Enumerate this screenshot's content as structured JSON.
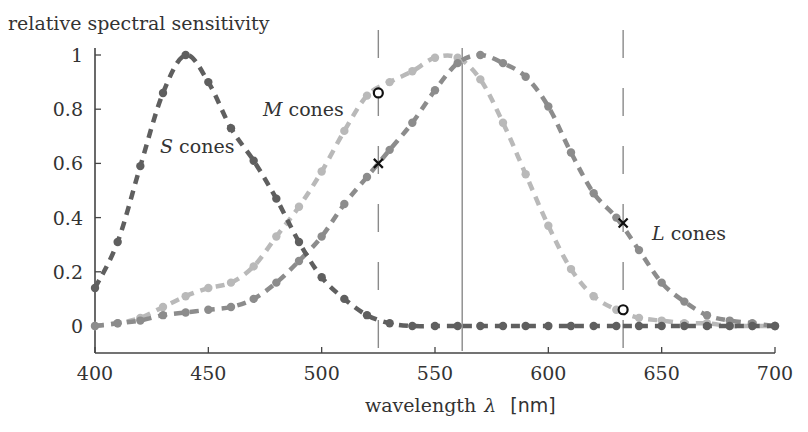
{
  "chart_data": {
    "type": "line",
    "title": "",
    "ylabel": "relative spectral sensitivity",
    "xlabel": "wavelength λ [nm]",
    "xlabel_text": "wavelength",
    "xlabel_symbol": "λ",
    "xlabel_unit": "[nm]",
    "xlim": [
      400,
      700
    ],
    "ylim": [
      -0.1,
      1.05
    ],
    "xticks": [
      400,
      450,
      500,
      550,
      600,
      650,
      700
    ],
    "yticks": [
      0,
      0.2,
      0.4,
      0.6,
      0.8,
      1
    ],
    "ytick_labels": [
      "0",
      "0.2",
      "0.4",
      "0.6",
      "0.8",
      "1"
    ],
    "xtick_labels": [
      "400",
      "450",
      "500",
      "550",
      "600",
      "650",
      "700"
    ],
    "grid": false,
    "legend": "none (inline labels)",
    "x": [
      400,
      410,
      420,
      430,
      440,
      450,
      460,
      470,
      480,
      490,
      500,
      510,
      520,
      530,
      540,
      550,
      560,
      570,
      580,
      590,
      600,
      610,
      620,
      630,
      640,
      650,
      660,
      670,
      680,
      690,
      700
    ],
    "series": [
      {
        "name": "S cones",
        "label_italic": "S",
        "label_rest": " cones",
        "color": "#5f5f5f",
        "values": [
          0.14,
          0.31,
          0.59,
          0.86,
          1.0,
          0.9,
          0.73,
          0.61,
          0.47,
          0.31,
          0.18,
          0.1,
          0.04,
          0.01,
          0.0,
          0.0,
          0.0,
          0.0,
          0.0,
          0.0,
          0.0,
          0.0,
          0.0,
          0.0,
          0.0,
          0.0,
          0.0,
          0.0,
          0.0,
          0.0,
          0.0
        ]
      },
      {
        "name": "M cones",
        "label_italic": "M",
        "label_rest": " cones",
        "color": "#b9b9b9",
        "values": [
          0.0,
          0.01,
          0.03,
          0.07,
          0.11,
          0.14,
          0.16,
          0.22,
          0.33,
          0.44,
          0.57,
          0.72,
          0.85,
          0.9,
          0.94,
          0.99,
          0.99,
          0.91,
          0.75,
          0.56,
          0.37,
          0.21,
          0.11,
          0.06,
          0.03,
          0.02,
          0.01,
          0.01,
          0.0,
          0.0,
          0.0
        ]
      },
      {
        "name": "L cones",
        "label_italic": "L",
        "label_rest": " cones",
        "color": "#8c8c8c",
        "values": [
          0.0,
          0.01,
          0.02,
          0.04,
          0.05,
          0.06,
          0.07,
          0.1,
          0.16,
          0.24,
          0.33,
          0.45,
          0.55,
          0.65,
          0.75,
          0.87,
          0.97,
          1.0,
          0.97,
          0.92,
          0.81,
          0.64,
          0.49,
          0.4,
          0.28,
          0.16,
          0.09,
          0.04,
          0.02,
          0.01,
          0.0
        ]
      }
    ],
    "vertical_lines": [
      {
        "x": 525,
        "style": "dashed"
      },
      {
        "x": 562,
        "style": "solid"
      },
      {
        "x": 633,
        "style": "dashed"
      }
    ],
    "markers": [
      {
        "x": 525,
        "y": 0.86,
        "symbol": "o",
        "series": "M cones"
      },
      {
        "x": 525,
        "y": 0.6,
        "symbol": "x",
        "series": "L cones"
      },
      {
        "x": 633,
        "y": 0.38,
        "symbol": "x",
        "series": "L cones"
      },
      {
        "x": 633,
        "y": 0.06,
        "symbol": "o",
        "series": "M cones"
      }
    ]
  }
}
